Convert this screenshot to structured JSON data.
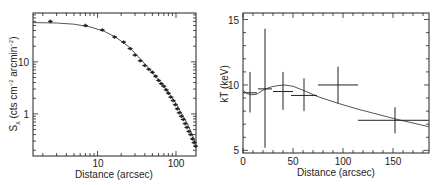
{
  "chart_data": [
    {
      "type": "scatter",
      "title": "",
      "xlabel": "Distance (arcsec)",
      "ylabel": "S_x (cts cm^-2 arcmin^-2)",
      "xscale": "log",
      "yscale": "log",
      "xlim": [
        1.5,
        180
      ],
      "ylim": [
        0.155,
        87
      ],
      "xticks": [
        10,
        100
      ],
      "yticks": [
        1,
        10
      ],
      "grid": false,
      "legend": null,
      "series": [
        {
          "name": "surface brightness data",
          "x": [
            2.5,
            7,
            11.5,
            16.5,
            21.5,
            26,
            30,
            35,
            40,
            45,
            50,
            55,
            60,
            65,
            70,
            75,
            80,
            86,
            92,
            98,
            104,
            110,
            117,
            124,
            131,
            138,
            146,
            154,
            162,
            170,
            178
          ],
          "y": [
            60,
            50,
            41,
            30,
            24,
            18,
            13.5,
            10.5,
            8.5,
            7.2,
            6.3,
            5.3,
            4.4,
            3.8,
            3.4,
            2.9,
            2.5,
            2.1,
            1.8,
            1.5,
            1.25,
            1.05,
            0.9,
            0.78,
            0.65,
            0.55,
            0.46,
            0.4,
            0.33,
            0.28,
            0.24
          ]
        },
        {
          "name": "beta model",
          "type": "line",
          "x": [
            1.5,
            3,
            5,
            8,
            12,
            17,
            25,
            35,
            50,
            70,
            100,
            140,
            180
          ],
          "y": [
            57,
            56,
            53,
            47,
            39,
            30,
            19.5,
            11.5,
            6.2,
            3.4,
            1.6,
            0.65,
            0.27
          ]
        }
      ]
    },
    {
      "type": "scatter",
      "title": "",
      "xlabel": "Distance (arcsec)",
      "ylabel": "kT (keV)",
      "xlim": [
        0,
        186
      ],
      "ylim": [
        4.8,
        15.5
      ],
      "xticks": [
        0,
        50,
        100,
        150
      ],
      "yticks": [
        5,
        10,
        15
      ],
      "grid": false,
      "legend": null,
      "series": [
        {
          "name": "temperature data",
          "x": [
            7,
            22,
            40,
            61,
            95,
            152
          ],
          "xerr_low": [
            7,
            7,
            10,
            13,
            20,
            37
          ],
          "xerr_high": [
            7,
            7,
            10,
            13,
            20,
            34
          ],
          "y": [
            9.4,
            9.7,
            9.5,
            9.2,
            10.0,
            7.3
          ],
          "yerr_low": [
            1.5,
            4.5,
            1.4,
            1.2,
            1.4,
            1.0
          ],
          "yerr_high": [
            1.6,
            4.6,
            1.5,
            1.3,
            1.4,
            1.0
          ]
        },
        {
          "name": "model profile",
          "type": "line",
          "x": [
            0,
            4,
            8,
            14,
            20,
            28,
            35,
            42,
            50,
            60,
            75,
            95,
            115,
            135,
            155,
            175,
            186
          ],
          "y": [
            9.6,
            9.35,
            9.25,
            9.3,
            9.6,
            9.85,
            9.95,
            10.0,
            9.9,
            9.6,
            9.1,
            8.6,
            8.15,
            7.75,
            7.35,
            7.0,
            6.8
          ]
        }
      ]
    }
  ],
  "left_plot": {
    "xlabel": "Distance (arcsec)",
    "ylabel_main": "S",
    "ylabel_sub": "x",
    "ylabel_rest": " (cts  cm",
    "ylabel_sup1": "−2",
    "ylabel_mid": " arcmin",
    "ylabel_sup2": "−2",
    "ylabel_end": ")",
    "xtick_labels": [
      "10",
      "100"
    ],
    "ytick_labels": [
      "1",
      "10"
    ]
  },
  "right_plot": {
    "xlabel": "Distance (arcsec)",
    "ylabel": "kT (keV)",
    "xtick_labels": [
      "0",
      "50",
      "100",
      "150"
    ],
    "ytick_labels": [
      "5",
      "10",
      "15"
    ]
  }
}
